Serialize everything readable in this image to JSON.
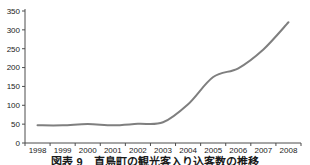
{
  "chart_data": {
    "type": "line",
    "title": "",
    "xlabel": "",
    "ylabel": "",
    "categories": [
      "1998",
      "1999",
      "2000",
      "2001",
      "2002",
      "2003",
      "2004",
      "2005",
      "2006",
      "2007",
      "2008"
    ],
    "values": [
      47,
      47,
      50,
      47,
      51,
      55,
      103,
      175,
      198,
      248,
      320
    ],
    "ylim": [
      0,
      350
    ],
    "yticks": [
      0,
      50,
      100,
      150,
      200,
      250,
      300,
      350
    ],
    "grid": false,
    "legend": false,
    "smoothed": true,
    "line_color": "#7f7f7f",
    "line_width": 2,
    "axis_color": "#4d4d4d",
    "tick_label_color": "#1a1a1a",
    "tick_font_size": 8
  },
  "caption": {
    "text": "図表 9　直島町の観光客入り込客数の推移"
  }
}
